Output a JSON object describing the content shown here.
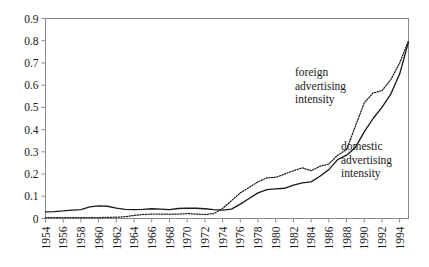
{
  "chart_data": {
    "type": "line",
    "title": "",
    "xlabel": "",
    "ylabel": "",
    "grid": false,
    "legend_position": "inline-annotations",
    "xlim": [
      1954,
      1995
    ],
    "ylim": [
      0,
      0.9
    ],
    "ytick_labels": [
      "0",
      "0.1",
      "0.2",
      "0.3",
      "0.4",
      "0.5",
      "0.6",
      "0.7",
      "0.8",
      "0.9"
    ],
    "ytick_values": [
      0,
      0.1,
      0.2,
      0.3,
      0.4,
      0.5,
      0.6,
      0.7,
      0.8,
      0.9
    ],
    "xtick_labels": [
      "1954",
      "1956",
      "1958",
      "1960",
      "1962",
      "1964",
      "1966",
      "1968",
      "1970",
      "1972",
      "1974",
      "1976",
      "1978",
      "1980",
      "1982",
      "1984",
      "1986",
      "1988",
      "1990",
      "1992",
      "1994"
    ],
    "xtick_values": [
      1954,
      1956,
      1958,
      1960,
      1962,
      1964,
      1966,
      1968,
      1970,
      1972,
      1974,
      1976,
      1978,
      1980,
      1982,
      1984,
      1986,
      1988,
      1990,
      1992,
      1994
    ],
    "x": [
      1954,
      1955,
      1956,
      1957,
      1958,
      1959,
      1960,
      1961,
      1962,
      1963,
      1964,
      1965,
      1966,
      1967,
      1968,
      1969,
      1970,
      1971,
      1972,
      1973,
      1974,
      1975,
      1976,
      1977,
      1978,
      1979,
      1980,
      1981,
      1982,
      1983,
      1984,
      1985,
      1986,
      1987,
      1988,
      1989,
      1990,
      1991,
      1992,
      1993,
      1994,
      1995
    ],
    "series": [
      {
        "name": "domestic advertising intensity",
        "style": "solid",
        "color": "#1a1a1a",
        "values": [
          0.03,
          0.031,
          0.034,
          0.038,
          0.04,
          0.052,
          0.057,
          0.055,
          0.047,
          0.041,
          0.04,
          0.041,
          0.044,
          0.042,
          0.04,
          0.045,
          0.047,
          0.046,
          0.044,
          0.04,
          0.038,
          0.042,
          0.065,
          0.09,
          0.115,
          0.13,
          0.133,
          0.136,
          0.15,
          0.16,
          0.165,
          0.19,
          0.22,
          0.265,
          0.285,
          0.32,
          0.39,
          0.45,
          0.5,
          0.56,
          0.65,
          0.795
        ]
      },
      {
        "name": "foreign advertising intensity",
        "style": "dotted",
        "color": "#1a1a1a",
        "values": [
          0.004,
          0.004,
          0.004,
          0.004,
          0.004,
          0.004,
          0.004,
          0.005,
          0.006,
          0.008,
          0.014,
          0.018,
          0.02,
          0.02,
          0.019,
          0.02,
          0.022,
          0.02,
          0.018,
          0.022,
          0.045,
          0.08,
          0.115,
          0.14,
          0.165,
          0.183,
          0.185,
          0.2,
          0.215,
          0.228,
          0.215,
          0.235,
          0.245,
          0.285,
          0.31,
          0.415,
          0.52,
          0.565,
          0.575,
          0.625,
          0.7,
          0.8
        ]
      }
    ],
    "annotations": [
      {
        "name": "foreign-series-label",
        "lines": [
          "foreign",
          "advertising",
          "intensity"
        ],
        "x_px": 295,
        "y_px": 76
      },
      {
        "name": "domestic-series-label",
        "lines": [
          "domestic",
          "advertising",
          "intensity"
        ],
        "x_px": 341,
        "y_px": 150
      }
    ]
  }
}
